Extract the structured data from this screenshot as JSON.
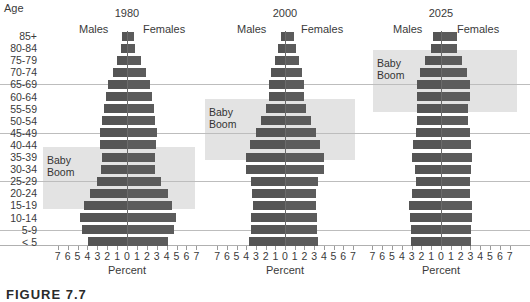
{
  "chart_data": {
    "type": "bar",
    "subtype": "population-pyramid",
    "y_header": "Age",
    "age_groups": [
      "85+",
      "80-84",
      "75-79",
      "70-74",
      "65-69",
      "60-64",
      "55-59",
      "50-54",
      "45-49",
      "40-44",
      "35-39",
      "30-34",
      "25-29",
      "20-24",
      "15-19",
      "10-14",
      "5-9",
      "< 5"
    ],
    "xlabel": "Percent",
    "x_ticks": [
      "7",
      "6",
      "5",
      "4",
      "3",
      "2",
      "1",
      "0",
      "1",
      "2",
      "3",
      "4",
      "5",
      "6",
      "7"
    ],
    "xlim": [
      -7,
      7
    ],
    "legend": {
      "left": "Males",
      "right": "Females"
    },
    "grid": "horizontal lines every 4 age groups",
    "panels": [
      {
        "title": "1980",
        "baby_boom": {
          "label_line1": "Baby",
          "label_line2": "Boom",
          "from_group": "35-39",
          "to_group": "15-19"
        },
        "series": [
          {
            "name": "Males",
            "values": [
              0.5,
              0.6,
              1.0,
              1.4,
              1.9,
              2.1,
              2.3,
              2.5,
              2.7,
              2.7,
              2.5,
              2.6,
              3.0,
              3.7,
              4.3,
              4.7,
              4.5,
              3.9
            ]
          },
          {
            "name": "Females",
            "values": [
              0.7,
              0.8,
              1.4,
              1.9,
              2.3,
              2.5,
              2.7,
              2.8,
              3.0,
              2.9,
              2.8,
              2.8,
              3.4,
              4.1,
              4.5,
              4.9,
              4.7,
              4.1
            ]
          }
        ]
      },
      {
        "title": "2000",
        "baby_boom": {
          "label_line1": "Baby",
          "label_line2": "Boom",
          "from_group": "55-59",
          "to_group": "35-39"
        },
        "series": [
          {
            "name": "Males",
            "values": [
              0.4,
              0.7,
              1.0,
              1.4,
              1.6,
              1.7,
              2.0,
              2.5,
              3.0,
              3.6,
              4.0,
              4.0,
              3.5,
              3.4,
              3.3,
              3.5,
              3.5,
              3.7
            ]
          },
          {
            "name": "Females",
            "values": [
              0.9,
              1.1,
              1.4,
              1.8,
              2.0,
              2.0,
              2.2,
              2.7,
              3.2,
              3.6,
              4.0,
              4.0,
              3.4,
              3.2,
              3.2,
              3.3,
              3.3,
              3.4
            ]
          }
        ]
      },
      {
        "title": "2025",
        "baby_boom": {
          "label_line1": "Baby",
          "label_line2": "Boom",
          "from_group": "75-79",
          "to_group": "55-59"
        },
        "series": [
          {
            "name": "Males",
            "values": [
              0.8,
              1.0,
              1.6,
              2.1,
              2.5,
              2.4,
              2.4,
              2.4,
              2.6,
              2.9,
              3.0,
              2.7,
              2.6,
              3.0,
              3.3,
              3.2,
              3.1,
              3.1
            ]
          },
          {
            "name": "Females",
            "values": [
              1.6,
              1.6,
              2.1,
              2.7,
              3.0,
              3.0,
              2.8,
              2.8,
              3.0,
              3.1,
              3.2,
              3.1,
              3.0,
              3.0,
              3.2,
              3.2,
              3.1,
              3.1
            ]
          }
        ]
      }
    ]
  },
  "caption": "FIGURE 7.7",
  "colors": {
    "bar": "#555555",
    "baby_boom_fill": "#e3e3e3",
    "gridline": "#bdbdbd"
  }
}
